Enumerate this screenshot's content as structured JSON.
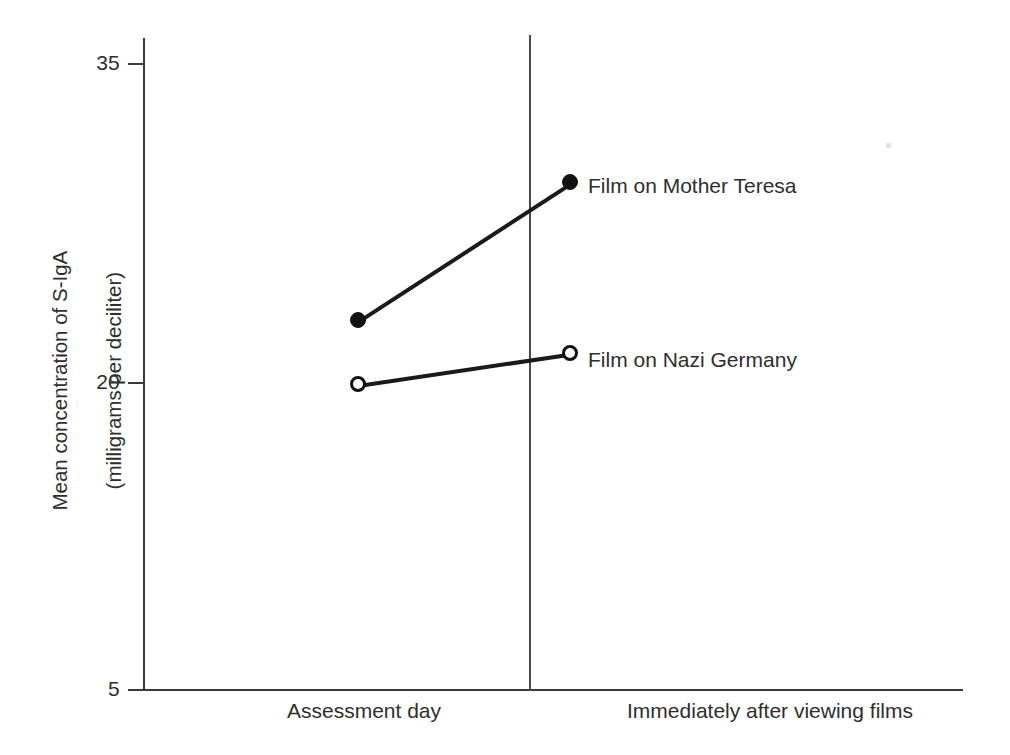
{
  "chart_data": {
    "type": "line",
    "title": "",
    "xlabel": "",
    "ylabel_line1": "Mean concentration of S-IgA",
    "ylabel_line2": "(milligrams per deciliter)",
    "categories": [
      "Assessment day",
      "Immediately after viewing films"
    ],
    "yticks": [
      "35",
      "20",
      "5"
    ],
    "ytick_values": [
      35,
      20,
      5
    ],
    "ylim": [
      5,
      35
    ],
    "grid": false,
    "legend_position": "right-inline",
    "series": [
      {
        "name": "Film on Mother Teresa",
        "marker": "filled-circle",
        "values": [
          22.7,
          29.3
        ]
      },
      {
        "name": "Film on Nazi Germany",
        "marker": "open-circle",
        "values": [
          19.6,
          21.1
        ]
      }
    ],
    "annotations": [
      "Vertical divider line separating the two assessment occasions"
    ],
    "colors": {
      "line": "#1a1a1a",
      "axis": "#3a3a3a",
      "text": "#2e2e2e",
      "background": "#ffffff"
    }
  },
  "axis": {
    "ytick_35": "35",
    "ytick_20": "20",
    "ytick_5": "5",
    "ylabel_line1": "Mean concentration of S-IgA",
    "ylabel_line2": "(milligrams per deciliter)",
    "xcat_1": "Assessment day",
    "xcat_2": "Immediately after viewing films"
  },
  "legend": {
    "teresa": "Film on Mother Teresa",
    "nazi": "Film on Nazi Germany"
  }
}
